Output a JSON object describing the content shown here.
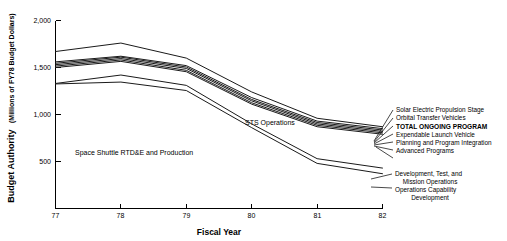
{
  "chart_data": {
    "type": "line",
    "title": "",
    "xlabel": "Fiscal Year",
    "ylabel": "Budget Authority",
    "ylabel_units": "(Millions of FY78 Budget Dollars)",
    "x": [
      "77",
      "78",
      "79",
      "80",
      "81",
      "82"
    ],
    "xlim": [
      "77",
      "82"
    ],
    "ylim": [
      0,
      2000
    ],
    "yticks": [
      500,
      1000,
      1500,
      2000
    ],
    "ytick_labels": [
      "500",
      "1,000",
      "1,500",
      "2,000"
    ],
    "grid": false,
    "legend_position": "right-annotations",
    "series": [
      {
        "name": "Solar Electric Propulsion Stage",
        "bold": false,
        "values": [
          1670,
          1760,
          1600,
          1240,
          960,
          870
        ]
      },
      {
        "name": "Orbital Transfer Vehicles",
        "bold": false,
        "values": [
          1560,
          1620,
          1520,
          1180,
          930,
          850
        ]
      },
      {
        "name": "TOTAL ONGOING PROGRAM",
        "bold": true,
        "values": [
          1545,
          1610,
          1505,
          1160,
          915,
          835
        ]
      },
      {
        "name": "Expendable Launch Vehicle",
        "bold": false,
        "values": [
          1530,
          1595,
          1490,
          1145,
          900,
          820
        ]
      },
      {
        "name": "Planning and Program Integration",
        "bold": false,
        "values": [
          1515,
          1580,
          1470,
          1125,
          885,
          805
        ]
      },
      {
        "name": "Advanced Programs",
        "bold": false,
        "values": [
          1500,
          1565,
          1455,
          1110,
          870,
          790
        ]
      },
      {
        "name": "Development, Test, and Mission Operations",
        "bold": false,
        "values": [
          1330,
          1420,
          1310,
          900,
          530,
          430
        ]
      },
      {
        "name": "Operations Capability Development",
        "bold": false,
        "values": [
          1325,
          1345,
          1255,
          860,
          480,
          370
        ]
      }
    ],
    "annotations": [
      {
        "text": "Space Shuttle RTD&E and Production",
        "x": 77.5,
        "y": 820
      },
      {
        "text": "STS Operations",
        "x": 79.4,
        "y": 1120
      }
    ],
    "legend_groups": [
      {
        "name": "upper-cluster",
        "labels": [
          {
            "text": "Solar Electric Propulsion Stage",
            "bold": false
          },
          {
            "text": "Orbital Transfer Vehicles",
            "bold": false
          },
          {
            "text": "TOTAL ONGOING PROGRAM",
            "bold": true
          },
          {
            "text": "Expendable Launch Vehicle",
            "bold": false
          },
          {
            "text": "Planning and Program Integration",
            "bold": false
          },
          {
            "text": "Advanced Programs",
            "bold": false
          }
        ]
      },
      {
        "name": "lower-cluster",
        "labels": [
          {
            "text": "Development, Test, and",
            "bold": false
          },
          {
            "text": "Mission Operations",
            "bold": false
          },
          {
            "text": "Operations Capability",
            "bold": false
          },
          {
            "text": "Development",
            "bold": false
          }
        ]
      }
    ]
  }
}
